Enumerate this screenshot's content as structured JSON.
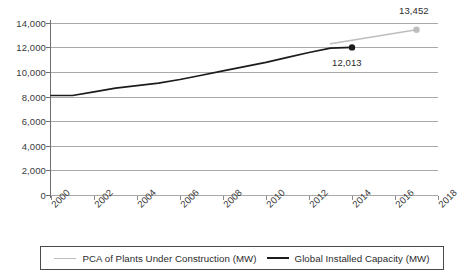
{
  "chart_data": {
    "type": "line",
    "title": "",
    "subtitle": "",
    "xlabel": "",
    "ylabel": "",
    "xlim": [
      2000,
      2018
    ],
    "ylim": [
      0,
      14000
    ],
    "grid": true,
    "legend_position": "bottom",
    "y_ticks": [
      "14,000",
      "12,000",
      "10,000",
      "8,000",
      "6,000",
      "4,000",
      "2,000",
      "0"
    ],
    "y_tick_values": [
      14000,
      12000,
      10000,
      8000,
      6000,
      4000,
      2000,
      0
    ],
    "x_ticks": [
      "2000",
      "2002",
      "2004",
      "2006",
      "2008",
      "2010",
      "2012",
      "2014",
      "2016",
      "2018"
    ],
    "x_tick_values": [
      2000,
      2002,
      2004,
      2006,
      2008,
      2010,
      2012,
      2014,
      2016,
      2018
    ],
    "series": [
      {
        "name": "Global Installed Capacity (MW)",
        "color": "#1c1c1c",
        "x": [
          2000,
          2001,
          2002,
          2003,
          2004,
          2005,
          2006,
          2007,
          2008,
          2009,
          2010,
          2011,
          2012,
          2013,
          2014
        ],
        "values": [
          8100,
          8100,
          8400,
          8700,
          8900,
          9100,
          9400,
          9750,
          10100,
          10450,
          10800,
          11200,
          11600,
          11950,
          12013
        ],
        "end_marker": true,
        "end_label": "12,013"
      },
      {
        "name": "PCA of Plants Under Construction (MW)",
        "color": "#bdbdbd",
        "x": [
          2013,
          2017
        ],
        "values": [
          12320,
          13452
        ],
        "end_marker": true,
        "end_label": "13,452"
      }
    ],
    "annotations": [
      {
        "text": "13,452",
        "value": 13452,
        "at_year": 2017,
        "series": "PCA of Plants Under Construction (MW)"
      },
      {
        "text": "12,013",
        "value": 12013,
        "at_year": 2014,
        "series": "Global Installed Capacity (MW)"
      }
    ]
  },
  "legend": {
    "entries": [
      {
        "label": "PCA of Plants Under Construction (MW)",
        "color": "#bdbdbd"
      },
      {
        "label": "Global Installed Capacity (MW)",
        "color": "#1c1c1c"
      }
    ]
  }
}
